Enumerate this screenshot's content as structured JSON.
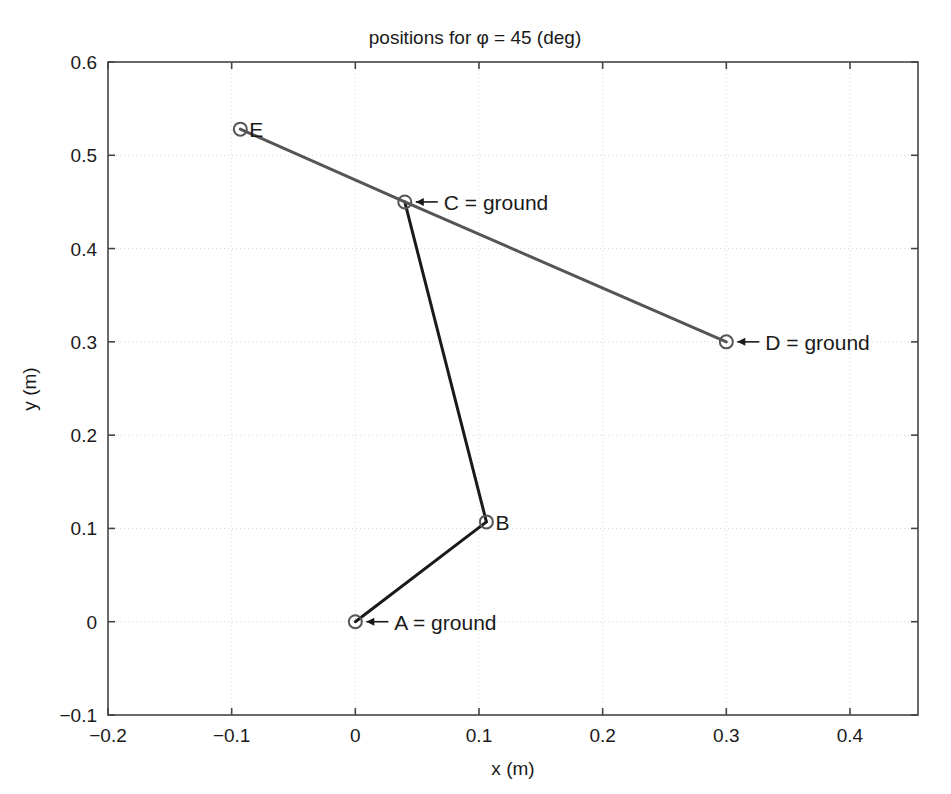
{
  "chart_data": {
    "type": "scatter",
    "title": "positions for φ = 45 (deg)",
    "xlabel": "x (m)",
    "ylabel": "y (m)",
    "xlim": [
      -0.2,
      0.455
    ],
    "ylim": [
      -0.1,
      0.6
    ],
    "grid": true,
    "legend": "none",
    "xticks": [
      "-0.2",
      "-0.1",
      "0",
      "0.1",
      "0.2",
      "0.3",
      "0.4"
    ],
    "xtick_values": [
      -0.2,
      -0.1,
      0,
      0.1,
      0.2,
      0.3,
      0.4
    ],
    "yticks": [
      "-0.1",
      "0",
      "0.1",
      "0.2",
      "0.3",
      "0.4",
      "0.5",
      "0.6"
    ],
    "ytick_values": [
      -0.1,
      0,
      0.1,
      0.2,
      0.3,
      0.4,
      0.5,
      0.6
    ],
    "points": [
      {
        "name": "A",
        "label": "A = ground",
        "x": 0.0,
        "y": 0.0,
        "label_anchor": "arrow-left"
      },
      {
        "name": "B",
        "label": "B",
        "x": 0.106,
        "y": 0.107,
        "label_anchor": "right"
      },
      {
        "name": "C",
        "label": "C = ground",
        "x": 0.04,
        "y": 0.45,
        "label_anchor": "arrow-left"
      },
      {
        "name": "D",
        "label": "D = ground",
        "x": 0.3,
        "y": 0.3,
        "label_anchor": "arrow-left"
      },
      {
        "name": "E",
        "label": "E",
        "x": -0.093,
        "y": 0.528,
        "label_anchor": "right"
      }
    ],
    "links": [
      {
        "name": "link-A-B",
        "from": "A",
        "to": "B",
        "color": "#1a1a1a",
        "width": 3.0
      },
      {
        "name": "link-B-C",
        "from": "B",
        "to": "C",
        "color": "#1a1a1a",
        "width": 3.0
      },
      {
        "name": "link-E-C",
        "from": "E",
        "to": "C",
        "color": "#555555",
        "width": 3.0
      },
      {
        "name": "link-C-D",
        "from": "C",
        "to": "D",
        "color": "#555555",
        "width": 3.0
      }
    ],
    "colors": {
      "axis": "#444444",
      "grid": "#d8d8d8",
      "marker_edge": "#555555",
      "background": "#ffffff",
      "text": "#1a1a1a"
    }
  }
}
